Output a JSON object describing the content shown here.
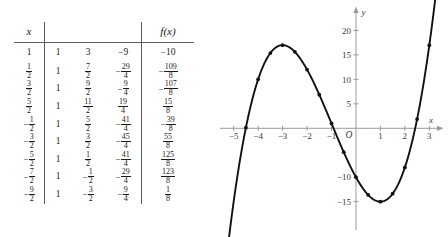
{
  "table": {
    "headers": {
      "x": "x",
      "fx": "f(x)"
    },
    "coefficient_headers": [
      "",
      "",
      ""
    ],
    "rows": [
      {
        "x": "1",
        "x_neg": false,
        "a": "1",
        "b": "3",
        "b_neg": false,
        "c": "9",
        "c_neg": true,
        "f": "10",
        "f_neg": true
      },
      {
        "x": "1/2",
        "x_neg": false,
        "a": "1",
        "b": "7/2",
        "b_neg": false,
        "c": "29/4",
        "c_neg": true,
        "f": "109/8",
        "f_neg": true
      },
      {
        "x": "3/2",
        "x_neg": false,
        "a": "1",
        "b": "9/2",
        "b_neg": false,
        "c": "9/4",
        "c_neg": true,
        "f": "107/8",
        "f_neg": true
      },
      {
        "x": "5/2",
        "x_neg": false,
        "a": "1",
        "b": "11/2",
        "b_neg": false,
        "c": "19/4",
        "c_neg": false,
        "f": "15/8",
        "f_neg": false
      },
      {
        "x": "1/2",
        "x_neg": true,
        "a": "1",
        "b": "5/2",
        "b_neg": false,
        "c": "41/4",
        "c_neg": true,
        "f": "39/8",
        "f_neg": true
      },
      {
        "x": "3/2",
        "x_neg": true,
        "a": "1",
        "b": "3/2",
        "b_neg": false,
        "c": "45/4",
        "c_neg": true,
        "f": "55/8",
        "f_neg": false
      },
      {
        "x": "5/2",
        "x_neg": true,
        "a": "1",
        "b": "1/2",
        "b_neg": false,
        "c": "41/4",
        "c_neg": true,
        "f": "125/8",
        "f_neg": false
      },
      {
        "x": "7/2",
        "x_neg": true,
        "a": "1",
        "b": "1/2",
        "b_neg": true,
        "c": "29/4",
        "c_neg": true,
        "f": "123/8",
        "f_neg": false
      },
      {
        "x": "9/2",
        "x_neg": true,
        "a": "1",
        "b": "3/2",
        "b_neg": true,
        "c": "9/4",
        "c_neg": true,
        "f": "1/8",
        "f_neg": false
      }
    ]
  },
  "chart_data": {
    "type": "line",
    "title": "",
    "xlabel": "x",
    "ylabel": "y",
    "xlim": [
      -5.6,
      3.6
    ],
    "ylim": [
      -21,
      25
    ],
    "grid": false,
    "legend": null,
    "origin_label": "O",
    "x_ticks": [
      -5,
      -4,
      -3,
      -2,
      -1,
      1,
      2,
      3
    ],
    "x_tick_labels": [
      "-5",
      "-4",
      "-3",
      "-2",
      "-1",
      "1",
      "2",
      "3"
    ],
    "y_ticks": [
      20,
      15,
      10,
      5,
      -10,
      -15
    ],
    "y_tick_labels": [
      "20",
      "15",
      "10",
      "5",
      "-10",
      "-15"
    ],
    "curve_description": "cubic f(x) = x^3 + 3x^2 - 9x - 10",
    "local_max": {
      "x": -3.0,
      "y": 17.0
    },
    "local_min": {
      "x": 1.0,
      "y": -15.0
    },
    "points": [
      {
        "x": -4.5,
        "y": 0.125
      },
      {
        "x": -4.0,
        "y": 10.0
      },
      {
        "x": -3.5,
        "y": 15.375
      },
      {
        "x": -3.0,
        "y": 17.0
      },
      {
        "x": -2.5,
        "y": 15.625
      },
      {
        "x": -2.0,
        "y": 12.0
      },
      {
        "x": -1.5,
        "y": 6.875
      },
      {
        "x": -1.0,
        "y": 1.0
      },
      {
        "x": -0.5,
        "y": -4.875
      },
      {
        "x": 0.0,
        "y": -10.0
      },
      {
        "x": 0.5,
        "y": -13.625
      },
      {
        "x": 1.0,
        "y": -15.0
      },
      {
        "x": 1.5,
        "y": -13.375
      },
      {
        "x": 2.0,
        "y": -8.0
      },
      {
        "x": 2.5,
        "y": 1.875
      },
      {
        "x": 3.0,
        "y": 17.0
      }
    ]
  }
}
